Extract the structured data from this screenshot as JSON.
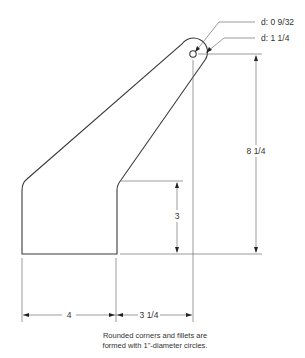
{
  "drawing": {
    "callouts": {
      "hole_diameter": "d: 0 9/32",
      "tab_diameter": "d: 1 1/4"
    },
    "dimensions": {
      "overall_height": "8 1/4",
      "step_height": "3",
      "left_width": "4",
      "right_width": "3 1/4"
    },
    "note": {
      "line1": "Rounded corners and fillets are",
      "line2": "formed with 1\"-diameter circles."
    }
  }
}
